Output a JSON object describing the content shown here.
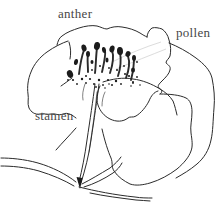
{
  "diagram": {
    "labels": [
      {
        "id": "anther",
        "text": "anther"
      },
      {
        "id": "pollen",
        "text": "pollen"
      },
      {
        "id": "stamen",
        "text": "stamen"
      }
    ],
    "colors": {
      "ink": "#2b2b2b",
      "background": "#ffffff",
      "label_text": "#474747",
      "faint_streak": "#dcdcdc"
    }
  }
}
